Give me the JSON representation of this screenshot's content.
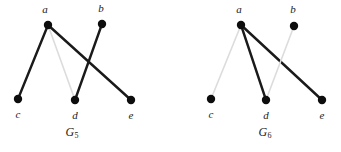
{
  "figure": {
    "background_color": "#ffffff",
    "edge_dark_color": "#1a1a1a",
    "edge_light_color": "#dcdcdc",
    "vertex_color": "#0d0d0d",
    "vertex_radius": 4.2
  },
  "graphs": [
    {
      "id": "G5",
      "caption_base": "G",
      "caption_sub": "5",
      "caption_x": 72,
      "caption_y": 133,
      "vertices": [
        {
          "id": "a",
          "label": "a",
          "x": 48,
          "y": 25,
          "label_x": 45,
          "label_y": 9
        },
        {
          "id": "b",
          "label": "b",
          "x": 102,
          "y": 24,
          "label_x": 101,
          "label_y": 8
        },
        {
          "id": "c",
          "label": "c",
          "x": 18,
          "y": 99,
          "label_x": 18,
          "label_y": 114
        },
        {
          "id": "d",
          "label": "d",
          "x": 75,
          "y": 100,
          "label_x": 75,
          "label_y": 115
        },
        {
          "id": "e",
          "label": "e",
          "x": 131,
          "y": 100,
          "label_x": 131,
          "label_y": 115
        }
      ],
      "edges": [
        {
          "from": "a",
          "to": "c",
          "style": "dark",
          "width": 2.4
        },
        {
          "from": "a",
          "to": "d",
          "style": "light",
          "width": 1.6
        },
        {
          "from": "a",
          "to": "e",
          "style": "dark",
          "width": 2.4
        },
        {
          "from": "b",
          "to": "d",
          "style": "dark",
          "width": 2.4
        }
      ]
    },
    {
      "id": "G6",
      "caption_base": "G",
      "caption_sub": "6",
      "caption_x": 265,
      "caption_y": 133,
      "vertices": [
        {
          "id": "a",
          "label": "a",
          "x": 241,
          "y": 25,
          "label_x": 239,
          "label_y": 9
        },
        {
          "id": "b",
          "label": "b",
          "x": 294,
          "y": 26,
          "label_x": 293,
          "label_y": 9
        },
        {
          "id": "c",
          "label": "c",
          "x": 211,
          "y": 99,
          "label_x": 211,
          "label_y": 114
        },
        {
          "id": "d",
          "label": "d",
          "x": 266,
          "y": 100,
          "label_x": 266,
          "label_y": 115
        },
        {
          "id": "e",
          "label": "e",
          "x": 322,
          "y": 100,
          "label_x": 322,
          "label_y": 115
        }
      ],
      "edges": [
        {
          "from": "a",
          "to": "c",
          "style": "light",
          "width": 1.6
        },
        {
          "from": "a",
          "to": "d",
          "style": "dark",
          "width": 2.4
        },
        {
          "from": "a",
          "to": "e",
          "style": "dark",
          "width": 2.4
        },
        {
          "from": "b",
          "to": "d",
          "style": "light",
          "width": 1.6
        }
      ]
    }
  ]
}
